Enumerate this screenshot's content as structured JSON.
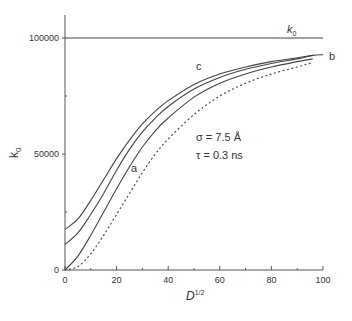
{
  "chart_data": {
    "type": "line",
    "title": "",
    "xlabel": "D",
    "xlabel_sup": "1/2",
    "ylabel": "k",
    "ylabel_sub": "0",
    "xlim": [
      0,
      100
    ],
    "ylim": [
      0,
      110000
    ],
    "grid": false,
    "x_ticks": [
      "0",
      "20",
      "40",
      "60",
      "80",
      "100"
    ],
    "y_ticks": [
      "0",
      "50000",
      "100000"
    ],
    "annotations": {
      "sigma": "σ = 7.5 Å",
      "tau": "τ = 0.3 ns",
      "k0_line_label": "k",
      "k0_line_sub": "0",
      "label_a": "a",
      "label_b": "b",
      "label_c": "c"
    },
    "x": [
      0,
      5,
      10,
      15,
      20,
      25,
      30,
      35,
      40,
      50,
      60,
      70,
      80,
      90,
      96
    ],
    "series": [
      {
        "name": "k0 (limit)",
        "style": "solid",
        "values": [
          100000,
          100000,
          100000,
          100000,
          100000,
          100000,
          100000,
          100000,
          100000,
          100000,
          100000,
          100000,
          100000,
          100000,
          100000
        ]
      },
      {
        "name": "c",
        "style": "solid",
        "values": [
          17500,
          22000,
          30000,
          39000,
          48000,
          56000,
          63000,
          68500,
          73000,
          80000,
          84500,
          87500,
          89800,
          91500,
          92500
        ]
      },
      {
        "name": "b",
        "style": "solid",
        "values": [
          11000,
          16000,
          24000,
          33000,
          43000,
          52000,
          59500,
          65500,
          70500,
          78000,
          83000,
          86500,
          89000,
          91000,
          92500
        ]
      },
      {
        "name": "a",
        "style": "solid",
        "values": [
          0,
          6000,
          15000,
          25000,
          35000,
          44500,
          53000,
          60000,
          65500,
          74500,
          80500,
          84500,
          87500,
          89800,
          91000
        ]
      },
      {
        "name": "dotted",
        "style": "dotted",
        "values": [
          0,
          1500,
          7000,
          15000,
          24000,
          33000,
          42000,
          50000,
          56500,
          67000,
          75000,
          80500,
          84500,
          87500,
          89500
        ]
      }
    ]
  }
}
